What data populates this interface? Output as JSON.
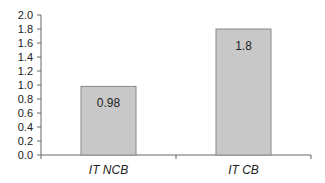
{
  "chart_data": {
    "type": "bar",
    "title": "",
    "xlabel": "",
    "ylabel": "",
    "categories": [
      "IT NCB",
      "IT CB"
    ],
    "values": [
      0.98,
      1.8
    ],
    "data_labels": [
      "0.98",
      "1.8"
    ],
    "ylim": [
      0,
      2.0
    ],
    "yticks": [
      0.0,
      0.2,
      0.4,
      0.6,
      0.8,
      1.0,
      1.2,
      1.4,
      1.6,
      1.8,
      2.0
    ],
    "ytick_labels": [
      "0.0",
      "0.2",
      "0.4",
      "0.6",
      "0.8",
      "1.0",
      "1.2",
      "1.4",
      "1.6",
      "1.8",
      "2.0"
    ],
    "grid": false,
    "legend": null,
    "colors": {
      "bar_fill": "#c8c8c8",
      "bar_stroke": "#888888",
      "axis": "#666666",
      "text": "#222222"
    }
  }
}
